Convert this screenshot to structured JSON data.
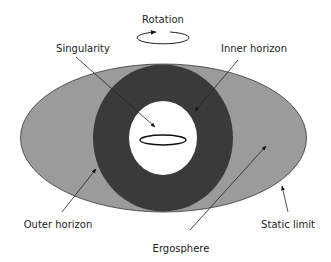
{
  "labels": {
    "rotation": "Rotation",
    "singularity": "Singularity",
    "inner_horizon": "Inner horizon",
    "outer_horizon": "Outer horizon",
    "static_limit": "Static limit",
    "ergosphere": "Ergosphere"
  },
  "colors": {
    "ergosphere_fill": "#9b9b9b",
    "horizon_fill": "#3a3a3a",
    "inner_fill": "#ffffff",
    "stroke": "#222222"
  }
}
